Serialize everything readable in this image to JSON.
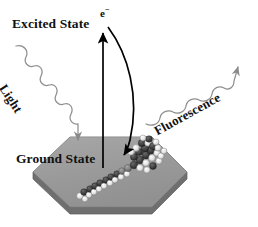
{
  "figure": {
    "type": "scientific-schematic"
  },
  "labels": {
    "excited_state": "Excited State",
    "ground_state": "Ground State",
    "electron": "e",
    "electron_charge": "−",
    "light": "Light",
    "fluorescence": "Fluorescence"
  },
  "colors": {
    "background": "#ffffff",
    "text": "#111111",
    "hexagon_top": "#9a9a9a",
    "hexagon_side": "#6f6f6f",
    "hexagon_edge": "#6a6a6a",
    "arrow": "#000000",
    "wave": "#8f8f8f",
    "molecule_dark": "#3a3a3a",
    "molecule_light": "#e8e8e8",
    "molecule_mid": "#808080"
  },
  "elements": {
    "excitation_arrow": "straight vertical up arrow",
    "emission_arrow": "curved arrow down to molecule",
    "light_wave": "squiggly incoming photon arrow",
    "fluorescence_wave": "squiggly outgoing photon arrow",
    "substrate": "hexagonal slab",
    "molecule": "space-filling molecular model"
  }
}
